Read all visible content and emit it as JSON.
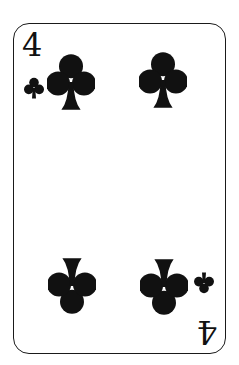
{
  "card": {
    "rank": "4",
    "suit": "clubs",
    "suit_icon": "club-icon",
    "color": "#111111",
    "pip_count": 4
  }
}
